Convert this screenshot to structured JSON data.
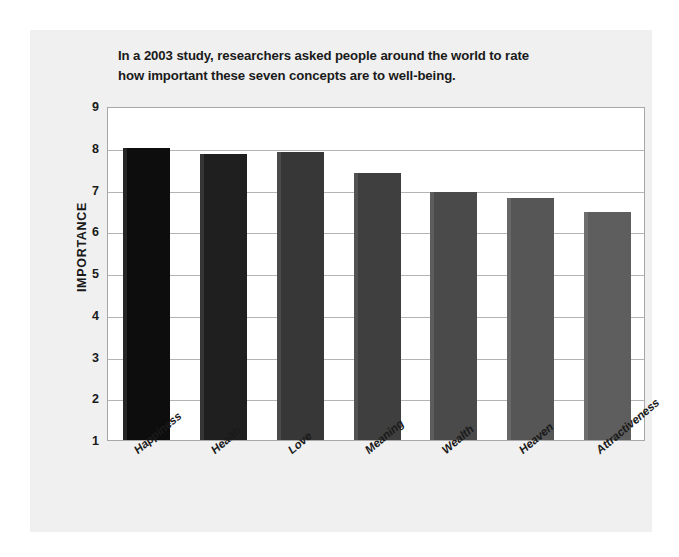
{
  "page": {
    "background_color": "#ffffff",
    "card_color": "#f0f0f0"
  },
  "chart_data": {
    "type": "bar",
    "title": "In a 2003 study, researchers asked people around the world to rate how important these seven concepts are to well-being.",
    "title_lines": [
      "In a 2003 study, researchers asked people around the world to rate",
      "how important these seven concepts are to well-being."
    ],
    "subtitle": "",
    "xlabel": "",
    "ylabel": "IMPORTANCE",
    "ylim": [
      1,
      9
    ],
    "ytick_labels": [
      "9",
      "8",
      "7",
      "6",
      "5",
      "4",
      "3",
      "2",
      "1"
    ],
    "yticks": [
      9,
      8,
      7,
      6,
      5,
      4,
      3,
      2,
      1
    ],
    "grid": true,
    "legend": false,
    "legend_position": "none",
    "categories": [
      "Happiness",
      "Health",
      "Love",
      "Meaning",
      "Wealth",
      "Heaven",
      "Attractiveness"
    ],
    "values": [
      8.0,
      7.85,
      7.9,
      7.4,
      6.95,
      6.8,
      6.45
    ],
    "bar_colors": [
      "#0d0d0d",
      "#1f1f1f",
      "#373737",
      "#3f3f3f",
      "#4a4a4a",
      "#565656",
      "#5e5e5e"
    ]
  }
}
